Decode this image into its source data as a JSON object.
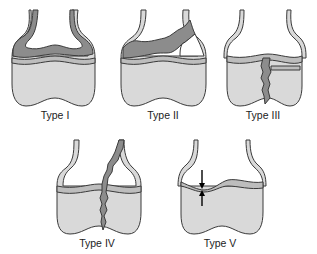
{
  "figure": {
    "panels": [
      {
        "id": "type-1",
        "label": "Type I"
      },
      {
        "id": "type-2",
        "label": "Type II"
      },
      {
        "id": "type-3",
        "label": "Type III"
      },
      {
        "id": "type-4",
        "label": "Type IV"
      },
      {
        "id": "type-5",
        "label": "Type V"
      }
    ],
    "colors": {
      "bone_fill": "#d9d9d9",
      "physis_fill": "#bdbdbd",
      "fracture_fill": "#8c8c8c",
      "outline": "#3a3a3a",
      "background": "#ffffff"
    }
  }
}
